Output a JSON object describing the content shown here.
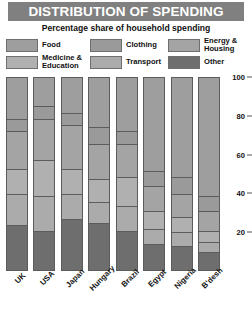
{
  "header": {
    "title": "DISTRIBUTION OF SPENDING",
    "subtitle": "Percentage share of household spending"
  },
  "legend": {
    "items": [
      {
        "label": "Food",
        "color": "#9e9e9e",
        "key": "food"
      },
      {
        "label": "Clothing",
        "color": "#9a9a9a",
        "key": "clothing"
      },
      {
        "label": "Energy &\nHousing",
        "color": "#a4a4a4",
        "key": "energy_housing"
      },
      {
        "label": "Medicine &\nEducation",
        "color": "#b0b0b0",
        "key": "medicine_education"
      },
      {
        "label": "Transport",
        "color": "#ababab",
        "key": "transport"
      },
      {
        "label": "Other",
        "color": "#6e6e6e",
        "key": "other"
      }
    ]
  },
  "axis": {
    "ticks": [
      "100",
      "80",
      "60",
      "40",
      "20"
    ],
    "tick_values": [
      100,
      80,
      60,
      40,
      20
    ],
    "min": 0,
    "max": 100
  },
  "colors": {
    "title_bar": "#808080",
    "outline": "#5c5c5c",
    "background": "#ffffff",
    "food": "#9e9e9e",
    "clothing": "#9a9a9a",
    "energy_housing": "#a4a4a4",
    "medicine_education": "#b0b0b0",
    "transport": "#ababab",
    "other": "#6e6e6e"
  },
  "chart_data": {
    "type": "bar",
    "stacked": true,
    "title": "DISTRIBUTION OF SPENDING",
    "subtitle": "Percentage share of household spending",
    "xlabel": "",
    "ylabel": "",
    "ylim": [
      0,
      100
    ],
    "yticks": [
      20,
      40,
      60,
      80,
      100
    ],
    "grid": false,
    "legend_position": "top",
    "categories": [
      "UK",
      "USA",
      "Japan",
      "Hungary",
      "Brazil",
      "Egypt",
      "Nigeria",
      "B'desh"
    ],
    "series": [
      {
        "name": "Food",
        "color": "#9e9e9e",
        "values": [
          22,
          15,
          19,
          26,
          28,
          49,
          52,
          62
        ]
      },
      {
        "name": "Clothing",
        "color": "#9a9a9a",
        "values": [
          6,
          7,
          6,
          9,
          7,
          8,
          9,
          8
        ]
      },
      {
        "name": "Energy & Housing",
        "color": "#a4a4a4",
        "values": [
          20,
          21,
          23,
          18,
          17,
          13,
          12,
          10
        ]
      },
      {
        "name": "Medicine & Education",
        "color": "#b0b0b0",
        "values": [
          13,
          19,
          13,
          12,
          15,
          9,
          8,
          6
        ]
      },
      {
        "name": "Transport",
        "color": "#ababab",
        "values": [
          16,
          18,
          13,
          11,
          13,
          8,
          7,
          5
        ]
      },
      {
        "name": "Other",
        "color": "#6e6e6e",
        "values": [
          23,
          20,
          26,
          24,
          20,
          13,
          12,
          9
        ]
      }
    ]
  },
  "xaxis": {
    "labels": [
      "UK",
      "USA",
      "Japan",
      "Hungary",
      "Brazil",
      "Egypt",
      "Nigeria",
      "B'desh"
    ]
  }
}
